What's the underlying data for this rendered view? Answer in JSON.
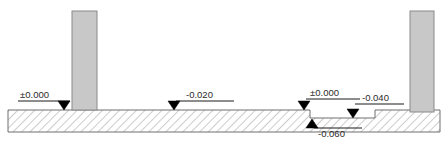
{
  "drawing": {
    "type": "architectural-section",
    "title": "Floor level section with columns",
    "canvas": {
      "width": 448,
      "height": 150
    },
    "colors": {
      "background": "#ffffff",
      "ground_outline": "#6e6e6e",
      "hatch_line": "#9a9a9a",
      "column_fill": "#c8c8c8",
      "column_outline": "#8a8a8a",
      "marker_fill": "#000000",
      "leader_line": "#1a1a1a",
      "text": "#2b2b2b"
    },
    "ground": {
      "label": "hatched-ground-slab",
      "left": 8,
      "right": 440,
      "top_level_y": 110,
      "step_level_y": 118,
      "bottom_y": 132,
      "step_start_x": 310,
      "step_end_x": 375,
      "hatch_angle_deg": 45,
      "hatch_spacing_px": 6
    },
    "columns": [
      {
        "name": "left-column",
        "x": 72,
        "y": 11,
        "width": 25,
        "height": 99
      },
      {
        "name": "right-column",
        "x": 410,
        "y": 11,
        "width": 24,
        "height": 101
      }
    ],
    "level_markers": [
      {
        "id": "level-0-left",
        "value": "±0.000",
        "elevation": 0.0,
        "marker_x": 64,
        "marker_y": 110,
        "direction": "down",
        "leader_x1": 18,
        "leader_x2": 70,
        "leader_y": 101,
        "text_x": 20,
        "text_y": 98,
        "text_anchor": "start"
      },
      {
        "id": "level-minus-020",
        "value": "-0.020",
        "elevation": -0.02,
        "marker_x": 174,
        "marker_y": 110,
        "direction": "down",
        "leader_x1": 176,
        "leader_x2": 234,
        "leader_y": 101,
        "text_x": 186,
        "text_y": 98,
        "text_anchor": "start"
      },
      {
        "id": "level-0-step",
        "value": "±0.000",
        "elevation": 0.0,
        "marker_x": 304,
        "marker_y": 110,
        "direction": "down",
        "leader_x1": 306,
        "leader_x2": 360,
        "leader_y": 99,
        "text_x": 310,
        "text_y": 96,
        "text_anchor": "start"
      },
      {
        "id": "level-minus-040",
        "value": "-0.040",
        "elevation": -0.04,
        "marker_x": 353,
        "marker_y": 118,
        "direction": "down",
        "leader_x1": 355,
        "leader_x2": 404,
        "leader_y": 104,
        "text_x": 362,
        "text_y": 101,
        "text_anchor": "start"
      },
      {
        "id": "level-minus-060",
        "value": "-0.060",
        "elevation": -0.06,
        "marker_x": 312,
        "marker_y": 119,
        "direction": "up",
        "leader_x1": 314,
        "leader_x2": 362,
        "leader_y": 128,
        "text_x": 318,
        "text_y": 137,
        "text_anchor": "start"
      }
    ]
  }
}
